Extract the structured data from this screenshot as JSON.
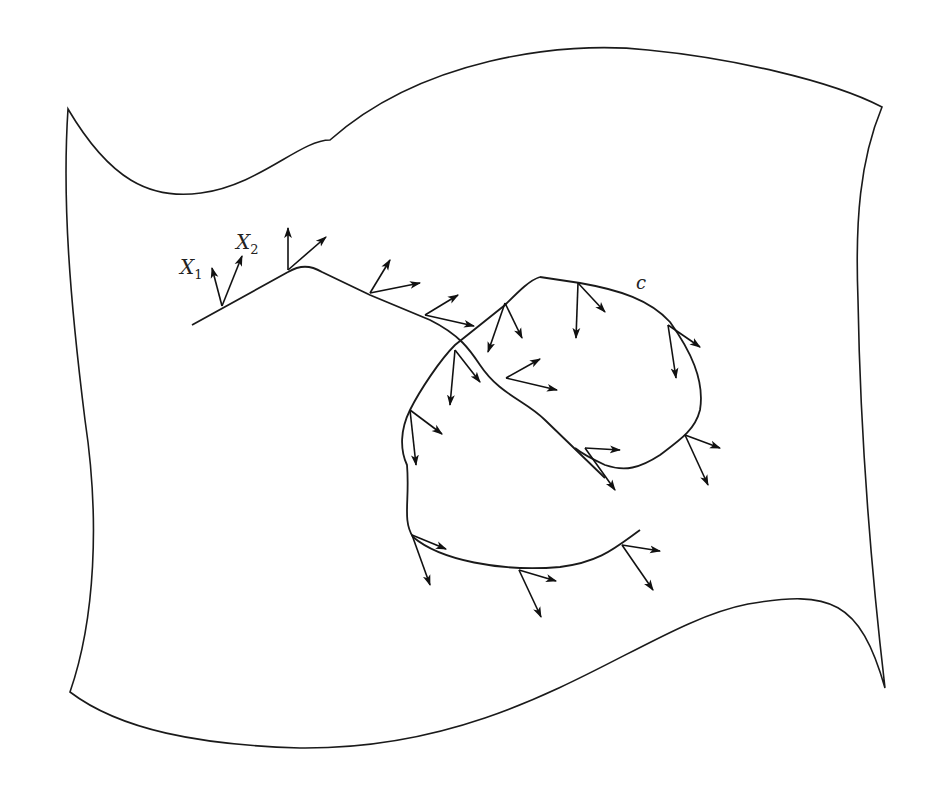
{
  "figure": {
    "type": "diagram",
    "labels": {
      "x1": "X",
      "x1_sub": "1",
      "x2": "X",
      "x2_sub": "2",
      "curve": "c"
    },
    "colors": {
      "stroke": "#1a1a1a",
      "background": "#ffffff"
    }
  }
}
